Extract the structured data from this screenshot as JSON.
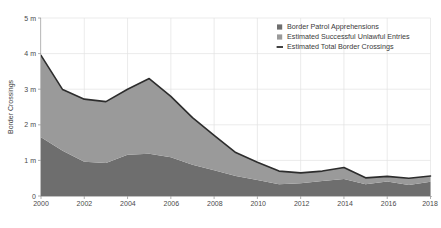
{
  "chart_data": {
    "type": "area",
    "title": "",
    "xlabel": "",
    "ylabel": "Border Crossings",
    "x": [
      2000,
      2001,
      2002,
      2003,
      2004,
      2005,
      2006,
      2007,
      2008,
      2009,
      2010,
      2011,
      2012,
      2013,
      2014,
      2015,
      2016,
      2017,
      2018
    ],
    "xticks": [
      "2000",
      "2002",
      "2004",
      "2006",
      "2008",
      "2010",
      "2012",
      "2014",
      "2016",
      "2018"
    ],
    "yticks": [
      "0",
      "1 m",
      "2 m",
      "3 m",
      "4 m",
      "5 m"
    ],
    "ytick_values": [
      0,
      1,
      2,
      3,
      4,
      5
    ],
    "ylim": [
      0,
      5
    ],
    "xlim": [
      2000,
      2018
    ],
    "grid": true,
    "legend_position": "top-right",
    "stacked": true,
    "series": [
      {
        "name": "Border Patrol Apprehensions",
        "color": "#6e6e6e",
        "values": [
          1.65,
          1.27,
          0.96,
          0.93,
          1.16,
          1.19,
          1.09,
          0.88,
          0.72,
          0.56,
          0.45,
          0.33,
          0.36,
          0.42,
          0.48,
          0.33,
          0.41,
          0.31,
          0.4
        ]
      },
      {
        "name": "Estimated Successful Unlawful Entries",
        "color": "#9a9a9a",
        "values": [
          2.3,
          1.72,
          1.76,
          1.72,
          1.84,
          2.11,
          1.71,
          1.32,
          0.98,
          0.66,
          0.5,
          0.37,
          0.29,
          0.28,
          0.32,
          0.18,
          0.14,
          0.19,
          0.16
        ]
      }
    ],
    "total_line": {
      "name": "Estimated Total Border Crossings",
      "color": "#2d2d2d",
      "values": [
        3.95,
        2.99,
        2.72,
        2.65,
        3.0,
        3.3,
        2.8,
        2.2,
        1.7,
        1.22,
        0.95,
        0.7,
        0.65,
        0.7,
        0.8,
        0.51,
        0.55,
        0.5,
        0.56
      ]
    }
  },
  "legend": {
    "items": [
      {
        "label": "Border Patrol Apprehensions",
        "marker": "square",
        "color": "#6e6e6e"
      },
      {
        "label": "Estimated Successful Unlawful Entries",
        "marker": "square",
        "color": "#9a9a9a"
      },
      {
        "label": "Estimated Total Border Crossings",
        "marker": "line",
        "color": "#2d2d2d"
      }
    ]
  },
  "axes": {
    "y_title": "Border Crossings",
    "y_tick_0": "0",
    "y_tick_1": "1 m",
    "y_tick_2": "2 m",
    "y_tick_3": "3 m",
    "y_tick_4": "4 m",
    "y_tick_5": "5 m",
    "x_tick_0": "2000",
    "x_tick_1": "2002",
    "x_tick_2": "2004",
    "x_tick_3": "2006",
    "x_tick_4": "2008",
    "x_tick_5": "2010",
    "x_tick_6": "2012",
    "x_tick_7": "2014",
    "x_tick_8": "2016",
    "x_tick_9": "2018"
  }
}
